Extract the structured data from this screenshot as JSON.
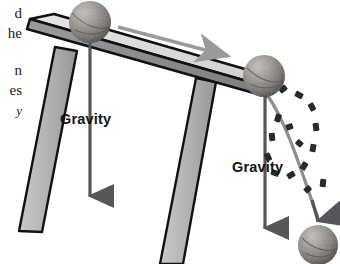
{
  "figure": {
    "type": "physics-diagram",
    "background_color": "#ffffff",
    "width": 340,
    "height": 264
  },
  "margin_text": {
    "note": "clipped body-text fragments from the facing page column",
    "lines": [
      {
        "text": "d",
        "x": 2,
        "y": 6,
        "italic": false
      },
      {
        "text": "he",
        "x": 2,
        "y": 26,
        "italic": false
      },
      {
        "text": "n",
        "x": 2,
        "y": 63,
        "italic": false
      },
      {
        "text": "es",
        "x": 2,
        "y": 83,
        "italic": false
      },
      {
        "text": "y",
        "x": 2,
        "y": 103,
        "italic": true
      }
    ]
  },
  "labels": [
    {
      "id": "gravity-left",
      "text": "Gravity",
      "x": 60,
      "y": 111,
      "color": "#121212"
    },
    {
      "id": "gravity-right",
      "text": "Gravity",
      "x": 232,
      "y": 159,
      "color": "#121212"
    }
  ],
  "colors": {
    "table_top_face": "#d9d9d9",
    "table_front_edge": "#8a8a8a",
    "table_leg": "#b3b3b3",
    "outline": "#111111",
    "ball_light": "#b8b4ae",
    "ball_mid": "#8d8a85",
    "ball_dark": "#4f4c48",
    "motion_arrow": "#9a9a9a",
    "gravity_arrow": "#55555a",
    "trajectory_line": "#8e8e8e",
    "dash_marks": "#2a2a2a"
  },
  "objects": {
    "table": {
      "name": "tilted-table",
      "top_slab": "tilted rectangular tabletop sloping down to the right",
      "legs": 2,
      "left_leg": "splayed leg angling down-left",
      "right_leg": "long leg angling down-right"
    },
    "balls": [
      {
        "id": "ball-on-table",
        "label": "ball at rest on the table top",
        "cx": 90,
        "cy": 22,
        "r": 21
      },
      {
        "id": "ball-at-edge",
        "label": "ball reaching the table edge",
        "cx": 264,
        "cy": 76,
        "r": 21
      },
      {
        "id": "ball-falling",
        "label": "ball after leaving the table",
        "cx": 318,
        "cy": 245,
        "r": 20
      }
    ],
    "arrows": [
      {
        "id": "motion-arrow",
        "label": "direction of rolling motion along the table",
        "color": "#9a9a9a"
      },
      {
        "id": "gravity-arrow-left",
        "label": "gravity force vector on the table ball",
        "color": "#55555a"
      },
      {
        "id": "gravity-arrow-right",
        "label": "gravity force vector at the table edge",
        "color": "#55555a"
      },
      {
        "id": "fall-arrow",
        "label": "resultant fall path arrow into the lower ball",
        "color": "#55555a"
      }
    ],
    "trajectory": {
      "id": "fall-trajectory",
      "label": "curved projectile path from table edge to the ground",
      "style": "solid gray curve flanked by dashed tick marks"
    }
  }
}
